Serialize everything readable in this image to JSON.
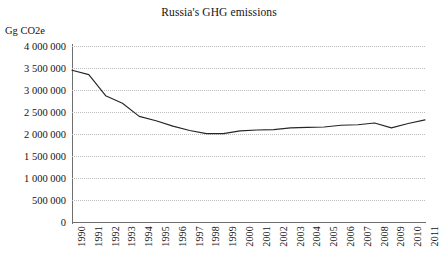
{
  "chart_data": {
    "type": "line",
    "title": "Russia's GHG emissions",
    "xlabel": "",
    "ylabel": "Gg CO2e",
    "ylim": [
      0,
      4000000
    ],
    "grid": true,
    "legend": false,
    "legend_position": "none",
    "line_color": "#262626",
    "gridline_color": "#bdbdbd",
    "axis_color": "#6e6e6e",
    "y_ticks": [
      0,
      500000,
      1000000,
      1500000,
      2000000,
      2500000,
      3000000,
      3500000,
      4000000
    ],
    "y_tick_labels": [
      "0",
      "500 000",
      "1 000 000",
      "1 500 000",
      "2 000 000",
      "2 500 000",
      "3 000 000",
      "3 500 000",
      "4 000 000"
    ],
    "categories": [
      "1990",
      "1991",
      "1992",
      "1993",
      "1994",
      "1995",
      "1996",
      "1997",
      "1998",
      "1999",
      "2000",
      "2001",
      "2002",
      "2003",
      "2004",
      "2005",
      "2006",
      "2007",
      "2008",
      "2009",
      "2010",
      "2011"
    ],
    "values": [
      3450000,
      3350000,
      2870000,
      2700000,
      2400000,
      2300000,
      2180000,
      2080000,
      2010000,
      2010000,
      2070000,
      2090000,
      2100000,
      2140000,
      2150000,
      2160000,
      2200000,
      2210000,
      2250000,
      2140000,
      2240000,
      2320000
    ],
    "series": [
      {
        "name": "Russia GHG emissions",
        "values": [
          3450000,
          3350000,
          2870000,
          2700000,
          2400000,
          2300000,
          2180000,
          2080000,
          2010000,
          2010000,
          2070000,
          2090000,
          2100000,
          2140000,
          2150000,
          2160000,
          2200000,
          2210000,
          2250000,
          2140000,
          2240000,
          2320000
        ]
      }
    ]
  }
}
